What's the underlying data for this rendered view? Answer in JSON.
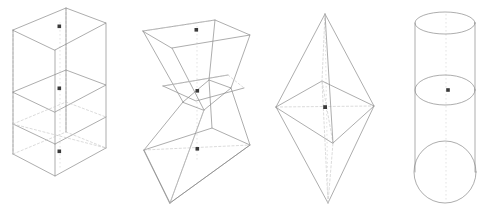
{
  "figure": {
    "title": "Wireframe 3D Solids Comparison",
    "background_color": "#ffffff",
    "width": 482,
    "height": 213,
    "style": {
      "visible_edge_color": "#8a8a8a",
      "hidden_edge_color": "#c8c8c8",
      "axis_color": "#d2d2d2",
      "centroid_color": "#3a3a3a",
      "edge_width": 0.7,
      "hidden_dash": "2.2 2.2"
    },
    "shape_count": 4,
    "annotation": "Each solid is drawn as a transparent wireframe with dashed hidden edges; small dark square markers mark the centroid of each stacked section."
  },
  "shapes": [
    {
      "id": "shape-1",
      "name": "stacked-rectangular-prism",
      "label": "Rectangular prism (3 stacked sections)",
      "type": "prism",
      "sections": 3,
      "centroid_markers": 3,
      "bounds": {
        "x": 8,
        "y": 4,
        "width": 105,
        "height": 205
      },
      "geometry": {
        "top_face": [
          [
            13,
            30
          ],
          [
            66,
            8
          ],
          [
            106,
            23
          ],
          [
            55,
            50
          ]
        ],
        "levels_y_offset": [
          0,
          62,
          124
        ],
        "vertical_extent": 186
      },
      "centroids": [
        [
          60,
          27
        ],
        [
          60,
          89
        ],
        [
          60,
          152
        ]
      ]
    },
    {
      "id": "shape-2",
      "name": "hourglass-antiprism",
      "label": "Antiprism hourglass (two opposed frusta)",
      "type": "antiprism",
      "sections": 3,
      "centroid_markers": 3,
      "bounds": {
        "x": 138,
        "y": 22,
        "width": 115,
        "height": 182
      },
      "geometry": {
        "top_rim": [
          [
            143,
            31
          ],
          [
            215,
            20
          ],
          [
            250,
            35
          ],
          [
            172,
            48
          ]
        ],
        "waist_rim": [
          [
            183,
            100
          ],
          [
            208,
            79
          ],
          [
            231,
            86
          ],
          [
            204,
            108
          ]
        ],
        "bottom_rim": [
          [
            144,
            150
          ],
          [
            210,
            128
          ],
          [
            250,
            145
          ],
          [
            170,
            203
          ]
        ],
        "waist_pinch": true
      },
      "centroids": [
        [
          196,
          30
        ],
        [
          197,
          91
        ],
        [
          197,
          149
        ]
      ]
    },
    {
      "id": "shape-3",
      "name": "square-bipyramid-octahedron",
      "label": "Square bipyramid (octahedron)",
      "type": "bipyramid",
      "sections": 2,
      "centroid_markers": 1,
      "bounds": {
        "x": 274,
        "y": 13,
        "width": 104,
        "height": 192
      },
      "geometry": {
        "apex_top": [
          325,
          14
        ],
        "apex_bottom": [
          328,
          203
        ],
        "equator": [
          [
            276,
            107
          ],
          [
            322,
            81
          ],
          [
            374,
            106
          ],
          [
            333,
            143
          ]
        ],
        "center": [
          325,
          107
        ]
      },
      "centroids": [
        [
          325,
          107
        ]
      ]
    },
    {
      "id": "shape-4",
      "name": "cylinder-stacked",
      "label": "Cylinder with mid cross-section",
      "type": "cylinder",
      "sections": 2,
      "centroid_markers": 1,
      "bounds": {
        "x": 415,
        "y": 10,
        "width": 60,
        "height": 195
      },
      "geometry": {
        "top_ellipse": {
          "cx": 445,
          "cy": 23,
          "rx": 30,
          "ry": 11
        },
        "mid_ellipse": {
          "cx": 445,
          "cy": 90,
          "rx": 30,
          "ry": 15
        },
        "bottom_circle": {
          "cx": 445,
          "cy": 172,
          "r": 31
        },
        "left_wall_x": 415,
        "right_wall_x": 475
      },
      "centroids": [
        [
          448,
          90
        ]
      ]
    }
  ],
  "legend": {
    "visible": false,
    "entries": [
      {
        "key": "solid-line",
        "meaning": "visible edge"
      },
      {
        "key": "dashed-line",
        "meaning": "hidden edge"
      },
      {
        "key": "dot",
        "meaning": "section centroid"
      }
    ]
  }
}
